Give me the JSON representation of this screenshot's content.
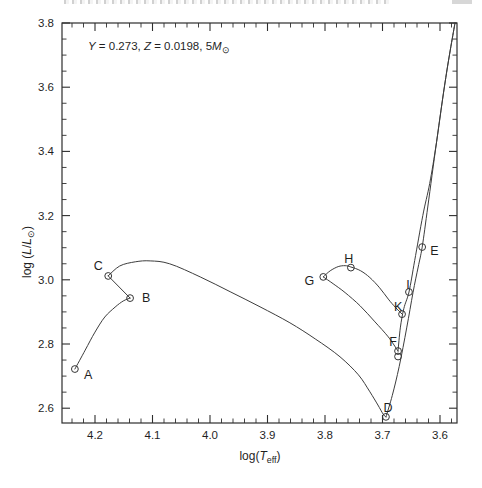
{
  "figure_kind": "stellar-evolution-track-hr-diagram",
  "chart_data": {
    "type": "line",
    "annotation": {
      "parts": [
        {
          "t": "Y",
          "style": "i"
        },
        {
          "t": " = 0.273, "
        },
        {
          "t": "Z",
          "style": "i"
        },
        {
          "t": " = 0.0198, 5"
        },
        {
          "t": "M",
          "style": "i"
        },
        {
          "t": "⊙",
          "style": "sub"
        }
      ],
      "plain": "Y = 0.273, Z = 0.0198, 5M⊙"
    },
    "xlabel": {
      "parts": [
        {
          "t": "log("
        },
        {
          "t": "T",
          "style": "i"
        },
        {
          "t": "eff",
          "style": "sub"
        },
        {
          "t": ")"
        }
      ],
      "plain": "log(Teff)"
    },
    "ylabel": {
      "parts": [
        {
          "t": "log ("
        },
        {
          "t": "L",
          "style": "i"
        },
        {
          "t": "/"
        },
        {
          "t": "L",
          "style": "i"
        },
        {
          "t": "⊙",
          "style": "sub"
        },
        {
          "t": ")"
        }
      ],
      "plain": "log (L/L⊙)"
    },
    "x_axis": {
      "reversed": true,
      "range": [
        4.256,
        3.57
      ],
      "major_ticks": [
        4.2,
        4.1,
        4.0,
        3.9,
        3.8,
        3.7,
        3.6
      ],
      "major_tick_labels": [
        "4.2",
        "4.1",
        "4.0",
        "3.9",
        "3.8",
        "3.7",
        "3.6"
      ],
      "minor_step": 0.02
    },
    "y_axis": {
      "range": [
        2.554,
        3.8
      ],
      "major_ticks": [
        3.8,
        3.6,
        3.4,
        3.2,
        3.0,
        2.8,
        2.6
      ],
      "major_tick_labels": [
        "3.8",
        "3.6",
        "3.4",
        "3.2",
        "3.0",
        "2.8",
        "2.6"
      ],
      "minor_step": 0.05
    },
    "grid": false,
    "points": [
      {
        "label": "A",
        "logTeff": 4.235,
        "logL": 2.722,
        "dx": 9,
        "dy": 6,
        "anchor": "start"
      },
      {
        "label": "B",
        "logTeff": 4.139,
        "logL": 2.943,
        "dx": 12,
        "dy": 0,
        "anchor": "start"
      },
      {
        "label": "C",
        "logTeff": 4.177,
        "logL": 3.012,
        "dx": -10,
        "dy": -10,
        "anchor": "middle"
      },
      {
        "label": "D",
        "logTeff": 3.694,
        "logL": 2.573,
        "dx": 2,
        "dy": -9,
        "anchor": "middle"
      },
      {
        "label": "E",
        "logTeff": 3.631,
        "logL": 3.102,
        "dx": 8,
        "dy": 4,
        "anchor": "start"
      },
      {
        "label": "F",
        "logTeff": 3.673,
        "logL": 2.778,
        "dx": -5,
        "dy": -9,
        "anchor": "middle"
      },
      {
        "label": "G",
        "logTeff": 3.803,
        "logL": 3.009,
        "dx": -9,
        "dy": 4,
        "anchor": "end"
      },
      {
        "label": "H",
        "logTeff": 3.755,
        "logL": 3.038,
        "dx": -2,
        "dy": -9,
        "anchor": "middle"
      },
      {
        "label": "I",
        "logTeff": 3.654,
        "logL": 2.962,
        "dx": -1,
        "dy": -7,
        "anchor": "middle"
      },
      {
        "label": "K",
        "logTeff": 3.666,
        "logL": 2.893,
        "dx": -4,
        "dy": -7,
        "anchor": "middle"
      }
    ],
    "extra_markers": [
      {
        "logTeff": 3.673,
        "logL": 2.761
      }
    ],
    "track_segments": [
      {
        "name": "A-B",
        "pts": [
          [
            4.235,
            2.722
          ],
          [
            4.217,
            2.781
          ],
          [
            4.2,
            2.837
          ],
          [
            4.183,
            2.884
          ],
          [
            4.165,
            2.915
          ],
          [
            4.151,
            2.934
          ],
          [
            4.139,
            2.943
          ]
        ]
      },
      {
        "name": "B-C",
        "pts": [
          [
            4.139,
            2.943
          ],
          [
            4.177,
            3.012
          ]
        ]
      },
      {
        "name": "C-D",
        "pts": [
          [
            4.177,
            3.012
          ],
          [
            4.157,
            3.043
          ],
          [
            4.13,
            3.056
          ],
          [
            4.104,
            3.059
          ],
          [
            4.07,
            3.05
          ],
          [
            4.017,
            3.009
          ],
          [
            3.965,
            2.963
          ],
          [
            3.913,
            2.916
          ],
          [
            3.861,
            2.866
          ],
          [
            3.817,
            2.816
          ],
          [
            3.774,
            2.76
          ],
          [
            3.742,
            2.704
          ],
          [
            3.722,
            2.651
          ],
          [
            3.708,
            2.61
          ],
          [
            3.699,
            2.582
          ],
          [
            3.694,
            2.573
          ]
        ]
      },
      {
        "name": "D-E-top",
        "pts": [
          [
            3.694,
            2.573
          ],
          [
            3.683,
            2.64
          ],
          [
            3.671,
            2.73
          ],
          [
            3.658,
            2.85
          ],
          [
            3.647,
            2.96
          ],
          [
            3.638,
            3.04
          ],
          [
            3.631,
            3.102
          ],
          [
            3.621,
            3.23
          ],
          [
            3.606,
            3.43
          ],
          [
            3.59,
            3.63
          ],
          [
            3.574,
            3.8
          ]
        ]
      },
      {
        "name": "F-I-top",
        "pts": [
          [
            3.673,
            2.778
          ],
          [
            3.669,
            2.85
          ],
          [
            3.663,
            2.91
          ],
          [
            3.654,
            2.962
          ],
          [
            3.644,
            3.06
          ],
          [
            3.63,
            3.2
          ],
          [
            3.618,
            3.3
          ],
          [
            3.606,
            3.43
          ],
          [
            3.59,
            3.63
          ],
          [
            3.574,
            3.8
          ]
        ]
      },
      {
        "name": "F-G",
        "pts": [
          [
            3.673,
            2.778
          ],
          [
            3.69,
            2.822
          ],
          [
            3.713,
            2.869
          ],
          [
            3.739,
            2.919
          ],
          [
            3.765,
            2.96
          ],
          [
            3.786,
            2.988
          ],
          [
            3.803,
            3.009
          ]
        ]
      },
      {
        "name": "G-H-K",
        "pts": [
          [
            3.803,
            3.009
          ],
          [
            3.791,
            3.028
          ],
          [
            3.777,
            3.041
          ],
          [
            3.765,
            3.044
          ],
          [
            3.755,
            3.04
          ],
          [
            3.738,
            3.028
          ],
          [
            3.722,
            3.007
          ],
          [
            3.705,
            2.975
          ],
          [
            3.69,
            2.94
          ],
          [
            3.678,
            2.915
          ],
          [
            3.666,
            2.893
          ]
        ]
      }
    ],
    "layout": {
      "plot": {
        "left": 62,
        "top": 23,
        "right": 457,
        "bottom": 423
      },
      "x_ref_val": 4.2,
      "x_ref_px": 95,
      "x_px_per_unit": 575,
      "y_ref_val": 3.8,
      "y_ref_px": 23,
      "y_px_per_unit": 321,
      "annotation_px": {
        "x": 88,
        "y": 50
      },
      "xlabel_px": {
        "x": 260,
        "y": 460
      },
      "ylabel_px": {
        "x": 31,
        "y": 252
      },
      "major_tick_len": 8,
      "minor_tick_len": 4.5
    },
    "colors": {
      "axis": "#2e2e2e",
      "track": "#3d3d3d",
      "marker": "#333333",
      "text": "#1f1f1f",
      "background": "#ffffff"
    },
    "marker_radius": 3.4
  }
}
